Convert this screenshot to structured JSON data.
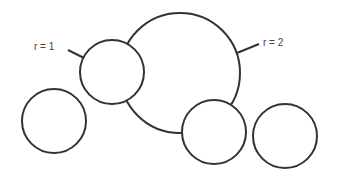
{
  "diagram": {
    "labels": {
      "small": "r = 1",
      "large": "r = 2"
    },
    "colors": {
      "stroke": "#333333",
      "fill": "#ffffff",
      "text": "#444444"
    },
    "circles": [
      {
        "id": "large-circle",
        "cx": 180,
        "cy": 73,
        "r": 60,
        "radius_label": "r = 2"
      },
      {
        "id": "small-circle-top",
        "cx": 112,
        "cy": 72,
        "r": 32,
        "radius_label": "r = 1"
      },
      {
        "id": "circle-left",
        "cx": 54,
        "cy": 121,
        "r": 32
      },
      {
        "id": "circle-bottom-middle",
        "cx": 214,
        "cy": 132,
        "r": 32
      },
      {
        "id": "circle-right",
        "cx": 285,
        "cy": 136,
        "r": 32
      }
    ]
  }
}
